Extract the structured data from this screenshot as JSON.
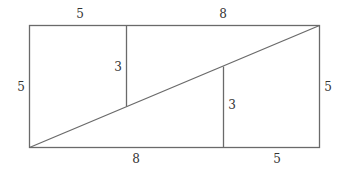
{
  "diagram": {
    "labels": {
      "top_left": "5",
      "top_right": "8",
      "left": "5",
      "right": "5",
      "bottom_left": "8",
      "bottom_right": "5",
      "inner_left": "3",
      "inner_right": "3"
    },
    "stroke_color": "#6a6a6a",
    "text_color": "#333333"
  }
}
